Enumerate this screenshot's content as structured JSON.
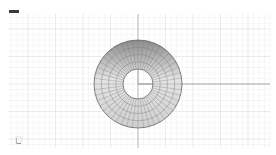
{
  "viewport": {
    "label": "Top",
    "background": "#ffffff",
    "grid": {
      "x_min": 8,
      "x_max": 270,
      "y_min": 14,
      "y_max": 148,
      "minor_spacing": 5.5,
      "major_every": 5,
      "minor_color": "#ececec",
      "major_color": "#d6d6d6"
    },
    "axes": {
      "x_axis_color": "#8a8a8a",
      "y_axis_color": "#9a9a9a",
      "origin": [
        138,
        84
      ]
    },
    "object": {
      "type": "torus-mesh",
      "center": [
        138,
        84
      ],
      "outer_radius": 44,
      "inner_radius": 15,
      "radial_segments": 48,
      "rings": 4,
      "fill_light": "#e4e4e4",
      "fill_dark": "#8c8c8c",
      "edge_color": "#555555"
    },
    "axis_widget": {
      "icon": "world-axes-icon"
    }
  }
}
